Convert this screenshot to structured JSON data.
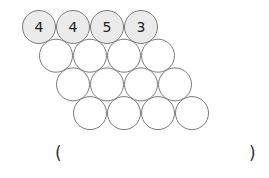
{
  "puzzle": {
    "rows": [
      {
        "cells": [
          "4",
          "4",
          "5",
          "3"
        ],
        "filled": true
      },
      {
        "cells": [
          "",
          "",
          "",
          ""
        ],
        "filled": false
      },
      {
        "cells": [
          "",
          "",
          "",
          ""
        ],
        "filled": false
      },
      {
        "cells": [
          "",
          "",
          "",
          ""
        ],
        "filled": false
      }
    ],
    "answer_open": "(",
    "answer_close": ")",
    "answer_value": ""
  },
  "colors": {
    "filled_circle": "#ebebeb",
    "stroke": "#7a7a7a",
    "text": "#222222"
  }
}
